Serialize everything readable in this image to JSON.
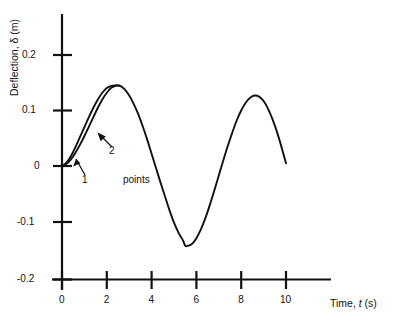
{
  "chart_data": {
    "type": "line",
    "title": "",
    "xlabel": "Time, t (s)",
    "ylabel": "Deflection, δ (m)",
    "xlim": [
      0,
      10.6
    ],
    "ylim": [
      -0.2,
      0.24
    ],
    "xticks": [
      0,
      2,
      4,
      6,
      8,
      10
    ],
    "xtick_labels": [
      "0",
      "2",
      "4",
      "6",
      "8",
      "10"
    ],
    "yticks": [
      0.2,
      0.1,
      0,
      -0.1,
      -0.2
    ],
    "ytick_labels": [
      "0.2",
      "0.1",
      "0",
      "-0.1",
      "-0.2"
    ],
    "grid": false,
    "legend": false,
    "line_color": "#111111",
    "series": [
      {
        "name": "1",
        "x": [
          0,
          0.2,
          0.4,
          0.6,
          0.8,
          1.0,
          1.2,
          1.4,
          1.6,
          1.8,
          2.0,
          2.2,
          2.4,
          2.5,
          2.6,
          2.8,
          3.0,
          3.2,
          3.4,
          3.6,
          3.8,
          4.0,
          4.2,
          4.4,
          4.6,
          4.8,
          5.0,
          5.2,
          5.4,
          5.5,
          5.6,
          5.8,
          6.0,
          6.2,
          6.4,
          6.6,
          6.8,
          7.0,
          7.2,
          7.4,
          7.6,
          7.8,
          8.0,
          8.2,
          8.4,
          8.6,
          8.8,
          9.0,
          9.2,
          9.4,
          9.6,
          9.8,
          10.0
        ],
        "y": [
          0,
          0.004,
          0.012,
          0.024,
          0.038,
          0.054,
          0.071,
          0.088,
          0.105,
          0.12,
          0.132,
          0.141,
          0.1448,
          0.145,
          0.1443,
          0.138,
          0.127,
          0.112,
          0.094,
          0.072,
          0.048,
          0.022,
          -0.004,
          -0.03,
          -0.055,
          -0.08,
          -0.102,
          -0.12,
          -0.134,
          -0.1435,
          -0.144,
          -0.1405,
          -0.13,
          -0.114,
          -0.094,
          -0.07,
          -0.044,
          -0.017,
          0.01,
          0.036,
          0.06,
          0.082,
          0.1,
          0.114,
          0.123,
          0.127,
          0.125,
          0.117,
          0.103,
          0.084,
          0.061,
          0.034,
          0.005
        ]
      },
      {
        "name": "2",
        "x": [
          0,
          0.2,
          0.4,
          0.6,
          0.8,
          1.0,
          1.2,
          1.4,
          1.6,
          1.8,
          2.0,
          2.2,
          2.4,
          2.5,
          2.6
        ],
        "y": [
          0,
          0.006,
          0.018,
          0.034,
          0.052,
          0.07,
          0.088,
          0.105,
          0.12,
          0.132,
          0.1405,
          0.1443,
          0.1452,
          0.145,
          0.1443
        ]
      }
    ],
    "annotations": [
      {
        "name": "curve-label-1",
        "text": "1",
        "x_px": 82,
        "y_px": 180
      },
      {
        "name": "curve-label-2",
        "text": "2",
        "x_px": 109,
        "y_px": 151
      },
      {
        "name": "points-label",
        "text": "points",
        "x_px": 123,
        "y_px": 180
      }
    ]
  }
}
